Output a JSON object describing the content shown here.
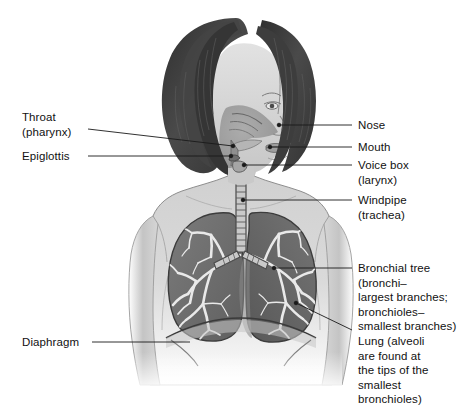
{
  "figure": {
    "background_color": "#ffffff",
    "line_color": "#1a1a1a",
    "text_color": "#111111"
  },
  "labels": {
    "throat": "Throat\n(pharynx)",
    "epiglottis": "Epiglottis",
    "diaphragm": "Diaphragm",
    "nose": "Nose",
    "mouth": "Mouth",
    "voice_box": "Voice box\n(larynx)",
    "windpipe": "Windpipe\n(trachea)",
    "bronchial_tree": "Bronchial tree\n(bronchi–\nlargest branches;\nbronchioles–\nsmallest branches)",
    "lung": "Lung (alveoli\nare found at\nthe tips of the\nsmallest\nbronchioles)"
  },
  "colors": {
    "lung_fill": "#6f6f6f",
    "lung_fill_dark": "#5d5d5d",
    "bronchi": "#e8e8e8",
    "skin_light": "#dcdcdc",
    "skin_shadow": "#b9b9b9",
    "hair_dark": "#3a3a3a",
    "hair_mid": "#555555",
    "cavity": "#9a9a9a",
    "trachea": "#c9c9c9"
  }
}
